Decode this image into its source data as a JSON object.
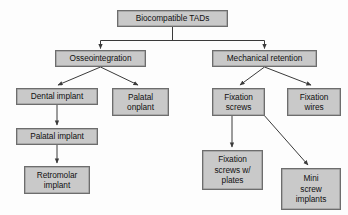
{
  "diagram": {
    "type": "flowchart",
    "background_color": "#fdfdfd",
    "node_fill_color": "#c9c9c9",
    "node_border_color": "#6d6d6d",
    "edge_color": "#3a3a3a",
    "text_color": "#111111",
    "nodes": [
      {
        "id": "root",
        "label": "Biocompatible TADs",
        "x": 117,
        "y": 10,
        "w": 111,
        "h": 17
      },
      {
        "id": "osseo",
        "label": "Osseointegration",
        "x": 55,
        "y": 50,
        "w": 91,
        "h": 17
      },
      {
        "id": "mech",
        "label": "Mechanical retention",
        "x": 212,
        "y": 50,
        "w": 105,
        "h": 17
      },
      {
        "id": "dental",
        "label": "Dental implant",
        "x": 16,
        "y": 88,
        "w": 82,
        "h": 17
      },
      {
        "id": "onplant",
        "label": "Palatal\nonplant",
        "x": 112,
        "y": 88,
        "w": 57,
        "h": 28
      },
      {
        "id": "fixscrews",
        "label": "Fixation\nscrews",
        "x": 212,
        "y": 88,
        "w": 53,
        "h": 28
      },
      {
        "id": "fixwires",
        "label": "Fixation\nwires",
        "x": 287,
        "y": 88,
        "w": 54,
        "h": 28
      },
      {
        "id": "palatal",
        "label": "Palatal implant",
        "x": 16,
        "y": 128,
        "w": 82,
        "h": 17
      },
      {
        "id": "retromolar",
        "label": "Retromolar\nimplant",
        "x": 24,
        "y": 166,
        "w": 66,
        "h": 28
      },
      {
        "id": "fixplates",
        "label": "Fixation\nscrews w/\nplates",
        "x": 202,
        "y": 150,
        "w": 61,
        "h": 40
      },
      {
        "id": "mini",
        "label": "Mini\nscrew\nimplants",
        "x": 281,
        "y": 168,
        "w": 60,
        "h": 42
      }
    ],
    "edges": [
      {
        "from": "root",
        "to": "osseo",
        "style": "elbow-down-split",
        "arrow": true
      },
      {
        "from": "root",
        "to": "mech",
        "style": "elbow-down-split",
        "arrow": true
      },
      {
        "from": "osseo",
        "to": "dental",
        "style": "diagonal",
        "arrow": true
      },
      {
        "from": "osseo",
        "to": "onplant",
        "style": "diagonal",
        "arrow": true
      },
      {
        "from": "mech",
        "to": "fixscrews",
        "style": "diagonal",
        "arrow": true
      },
      {
        "from": "mech",
        "to": "fixwires",
        "style": "diagonal",
        "arrow": true
      },
      {
        "from": "dental",
        "to": "palatal",
        "style": "straight-down",
        "arrow": true
      },
      {
        "from": "palatal",
        "to": "retromolar",
        "style": "straight-down",
        "arrow": true
      },
      {
        "from": "fixscrews",
        "to": "fixplates",
        "style": "straight-down",
        "arrow": true
      },
      {
        "from": "fixscrews",
        "to": "mini",
        "style": "diagonal",
        "arrow": true
      }
    ]
  }
}
